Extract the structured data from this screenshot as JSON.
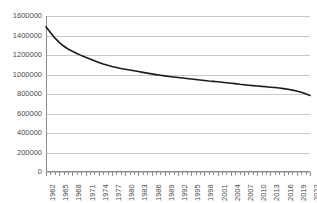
{
  "chart_data": {
    "type": "line",
    "title": "",
    "subtitle": "",
    "xlabel": "",
    "ylabel": "",
    "xlim": [
      1962,
      2022
    ],
    "ylim": [
      0,
      1600000
    ],
    "ytick_values": [
      0,
      200000,
      400000,
      600000,
      800000,
      1000000,
      1200000,
      1400000,
      1600000
    ],
    "ytick_labels": [
      "0",
      "200000",
      "400000",
      "600000",
      "800000",
      "1000000",
      "1200000",
      "1400000",
      "1600000"
    ],
    "xtick_labels": [
      "1962",
      "1965",
      "1968",
      "1971",
      "1974",
      "1977",
      "1980",
      "1983",
      "1986",
      "1989",
      "1992",
      "1995",
      "1998",
      "2001",
      "2004",
      "2007",
      "2010",
      "2013",
      "2016",
      "2019",
      "2022"
    ],
    "xtick_step_years": 3,
    "minor_tick_per_year": true,
    "grid": "horizontal",
    "legend": "none",
    "line_color": "#1a1a1a",
    "grid_color": "#c9c9c9",
    "axis_color": "#8c8c8c",
    "background_color": "#ffffff",
    "x": [
      1962,
      1963,
      1964,
      1965,
      1966,
      1967,
      1968,
      1969,
      1970,
      1971,
      1972,
      1973,
      1974,
      1975,
      1976,
      1977,
      1978,
      1979,
      1980,
      1981,
      1982,
      1983,
      1984,
      1985,
      1986,
      1987,
      1988,
      1989,
      1990,
      1991,
      1992,
      1993,
      1994,
      1995,
      1996,
      1997,
      1998,
      1999,
      2000,
      2001,
      2002,
      2003,
      2004,
      2005,
      2006,
      2007,
      2008,
      2009,
      2010,
      2011,
      2012,
      2013,
      2014,
      2015,
      2016,
      2017,
      2018,
      2019,
      2020,
      2021,
      2022
    ],
    "values": [
      1490000,
      1430000,
      1375000,
      1330000,
      1292000,
      1262000,
      1238000,
      1216000,
      1196000,
      1178000,
      1160000,
      1142000,
      1124000,
      1108000,
      1094000,
      1082000,
      1072000,
      1062000,
      1054000,
      1046000,
      1038000,
      1030000,
      1022000,
      1014000,
      1006000,
      999000,
      992000,
      986000,
      980000,
      974000,
      969000,
      964000,
      959000,
      953000,
      948000,
      943000,
      938000,
      933000,
      929000,
      925000,
      921000,
      916000,
      911000,
      906000,
      900000,
      895000,
      890000,
      886000,
      882000,
      878000,
      874000,
      870000,
      866000,
      861000,
      855000,
      848000,
      840000,
      830000,
      818000,
      802000,
      785000
    ],
    "series": [
      {
        "name": "",
        "values": [
          1490000,
          1430000,
          1375000,
          1330000,
          1292000,
          1262000,
          1238000,
          1216000,
          1196000,
          1178000,
          1160000,
          1142000,
          1124000,
          1108000,
          1094000,
          1082000,
          1072000,
          1062000,
          1054000,
          1046000,
          1038000,
          1030000,
          1022000,
          1014000,
          1006000,
          999000,
          992000,
          986000,
          980000,
          974000,
          969000,
          964000,
          959000,
          953000,
          948000,
          943000,
          938000,
          933000,
          929000,
          925000,
          921000,
          916000,
          911000,
          906000,
          900000,
          895000,
          890000,
          886000,
          882000,
          878000,
          874000,
          870000,
          866000,
          861000,
          855000,
          848000,
          840000,
          830000,
          818000,
          802000,
          785000
        ]
      }
    ]
  }
}
